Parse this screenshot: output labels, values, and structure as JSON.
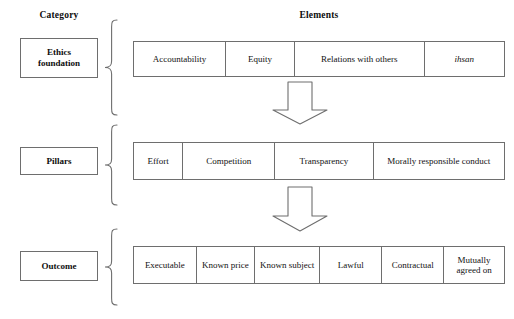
{
  "headers": {
    "category": "Category",
    "elements": "Elements"
  },
  "rows": [
    {
      "category": "Ethics\nfoundation",
      "category_label": "Ethics foundation",
      "cells": [
        {
          "label": "Accountability",
          "italic": false,
          "flex": 92
        },
        {
          "label": "Equity",
          "italic": false,
          "flex": 68
        },
        {
          "label": "Relations with others",
          "italic": false,
          "flex": 132
        },
        {
          "label": "ihsan",
          "italic": true,
          "flex": 80
        }
      ]
    },
    {
      "category": "Pillars",
      "category_label": "Pillars",
      "cells": [
        {
          "label": "Effort",
          "italic": false,
          "flex": 47
        },
        {
          "label": "Competition",
          "italic": false,
          "flex": 92
        },
        {
          "label": "Transparency",
          "italic": false,
          "flex": 99
        },
        {
          "label": "Morally responsible conduct",
          "italic": false,
          "flex": 134
        }
      ]
    },
    {
      "category": "Outcome",
      "category_label": "Outcome",
      "cells": [
        {
          "label": "Executable",
          "italic": false,
          "flex": 63
        },
        {
          "label": "Known price",
          "italic": false,
          "flex": 58
        },
        {
          "label": "Known subject",
          "italic": false,
          "flex": 66
        },
        {
          "label": "Lawful",
          "italic": false,
          "flex": 62
        },
        {
          "label": "Contractual",
          "italic": false,
          "flex": 62
        },
        {
          "label": "Mutually agreed on",
          "italic": false,
          "flex": 61
        }
      ]
    }
  ],
  "arrows": [
    {
      "name": "down-arrow-ethics-to-pillars",
      "direction": "down"
    },
    {
      "name": "down-arrow-pillars-to-outcome",
      "direction": "down"
    }
  ],
  "braces": [
    {
      "name": "brace-ethics-foundation"
    },
    {
      "name": "brace-pillars"
    },
    {
      "name": "brace-outcome"
    }
  ],
  "colors": {
    "line": "#6e6e6e",
    "text": "#111111",
    "background": "#ffffff"
  }
}
